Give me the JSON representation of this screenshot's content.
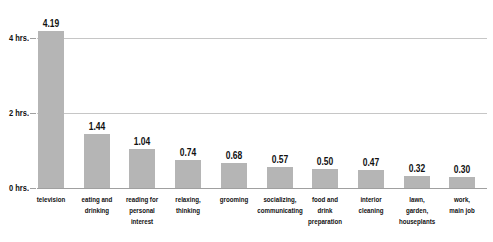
{
  "chart_data": {
    "type": "bar",
    "title": "",
    "xlabel": "",
    "ylabel": "",
    "legend": "none",
    "grid": true,
    "categories": [
      "television",
      "eating and drinking",
      "reading for personal interest",
      "relaxing, thinking",
      "grooming",
      "socializing, communicating",
      "food and drink preparation",
      "interior cleaning",
      "lawn, garden, houseplants",
      "work, main job"
    ],
    "category_label_lines": [
      [
        "television"
      ],
      [
        "eating and",
        "drinking"
      ],
      [
        "reading for",
        "personal",
        "interest"
      ],
      [
        "relaxing,",
        "thinking"
      ],
      [
        "grooming"
      ],
      [
        "socializing,",
        "communicating"
      ],
      [
        "food and",
        "drink",
        "preparation"
      ],
      [
        "interior",
        "cleaning"
      ],
      [
        "lawn,",
        "garden,",
        "houseplants"
      ],
      [
        "work,",
        "main job"
      ]
    ],
    "values": [
      4.19,
      1.44,
      1.04,
      0.74,
      0.68,
      0.57,
      0.5,
      0.47,
      0.32,
      0.3
    ],
    "value_labels": [
      "4.19",
      "1.44",
      "1.04",
      "0.74",
      "0.68",
      "0.57",
      "0.50",
      "0.47",
      "0.32",
      "0.30"
    ],
    "y_axis": {
      "range": [
        0,
        4.4
      ],
      "ticks": [
        {
          "value": 0,
          "label": "0 hrs."
        },
        {
          "value": 2,
          "label": "2 hrs."
        },
        {
          "value": 4,
          "label": "4 hrs."
        }
      ]
    },
    "colors": {
      "bar": "#b5b5b5",
      "gridline": "#c6c6c6",
      "axis": "#a0a0a0",
      "text": "#111111",
      "background": "#ffffff"
    }
  }
}
